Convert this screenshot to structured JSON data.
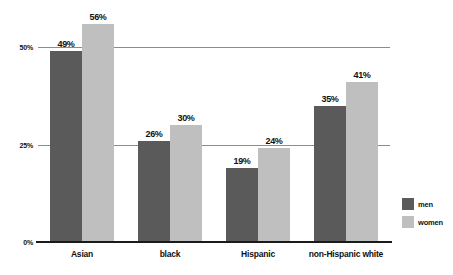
{
  "chart_data": {
    "type": "bar",
    "title": "",
    "subtitle": "",
    "xlabel": "",
    "ylabel": "",
    "categories": [
      "Asian",
      "black",
      "Hispanic",
      "non-Hispanic white"
    ],
    "series": [
      {
        "name": "men",
        "color": "#5a5a5a",
        "values": [
          49,
          26,
          19,
          35
        ],
        "labels": [
          "49%",
          "26%",
          "19%",
          "35%"
        ]
      },
      {
        "name": "women",
        "color": "#bfbfbf",
        "values": [
          56,
          30,
          24,
          41
        ],
        "labels": [
          "56%",
          "30%",
          "24%",
          "41%"
        ]
      }
    ],
    "ylim": [
      0,
      60
    ],
    "yticks": [
      0,
      25,
      50
    ],
    "ytick_labels": [
      "0%",
      "25%",
      "50%"
    ],
    "gridlines_at": [
      25,
      50
    ],
    "grid": true,
    "legend_position": "right",
    "value_labels_shown": true,
    "baseline_color": "#1a1a1a",
    "gridline_color": "#8c8c8c",
    "background": "#ffffff"
  }
}
